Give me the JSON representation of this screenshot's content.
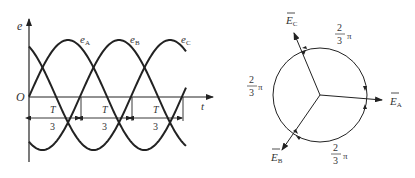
{
  "waveform": {
    "y_axis_label": "e",
    "x_axis_label": "t",
    "origin_label": "O",
    "curves": [
      {
        "name": "eA",
        "label_main": "e",
        "label_sub": "A",
        "phase_deg": 0
      },
      {
        "name": "eB",
        "label_main": "e",
        "label_sub": "B",
        "phase_deg": -120
      },
      {
        "name": "eC",
        "label_main": "e",
        "label_sub": "C",
        "phase_deg": -240
      }
    ],
    "intervals": [
      {
        "numerator": "T",
        "denominator": "3"
      },
      {
        "numerator": "T",
        "denominator": "3"
      },
      {
        "numerator": "T",
        "denominator": "3"
      }
    ]
  },
  "phasor": {
    "vectors": [
      {
        "name": "EA",
        "label_main": "E",
        "label_sub": "A",
        "angle_deg": -5
      },
      {
        "name": "EB",
        "label_main": "E",
        "label_sub": "B",
        "angle_deg": -125
      },
      {
        "name": "EC",
        "label_main": "E",
        "label_sub": "C",
        "angle_deg": 115
      }
    ],
    "angle_labels": [
      {
        "numerator": "2",
        "denominator": "3",
        "unit": "π"
      },
      {
        "numerator": "2",
        "denominator": "3",
        "unit": "π"
      },
      {
        "numerator": "2",
        "denominator": "3",
        "unit": "π"
      }
    ]
  },
  "colors": {
    "stroke": "#222222",
    "text": "#333333",
    "background": "#ffffff"
  }
}
